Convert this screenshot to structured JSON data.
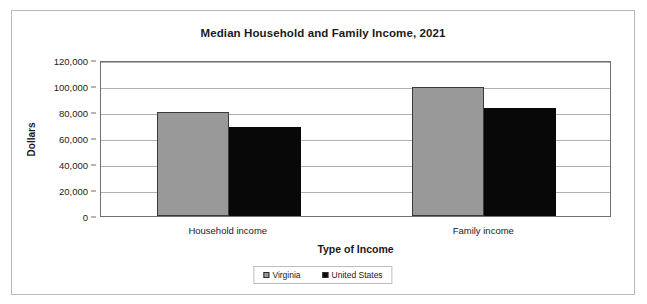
{
  "chart_data": {
    "type": "bar",
    "title": "Median Household and Family Income, 2021",
    "xlabel": "Type of Income",
    "ylabel": "Dollars",
    "categories": [
      "Household income",
      "Family income"
    ],
    "series": [
      {
        "name": "Virginia",
        "color": "#999999",
        "values": [
          80000,
          99000
        ]
      },
      {
        "name": "United States",
        "color": "#080808",
        "values": [
          68500,
          83000
        ]
      }
    ],
    "ylim": [
      0,
      120000
    ],
    "ytick_values": [
      0,
      20000,
      40000,
      60000,
      80000,
      100000,
      120000
    ],
    "ytick_labels": [
      "0",
      "20,000",
      "40,000",
      "60,000",
      "80,000",
      "100,000",
      "120,000"
    ],
    "grid": true,
    "legend_position": "bottom"
  },
  "legend": {
    "entries": [
      {
        "label": "Virginia",
        "swatch": "virginia-swatch-icon"
      },
      {
        "label": "United States",
        "swatch": "united-states-swatch-icon"
      }
    ]
  }
}
